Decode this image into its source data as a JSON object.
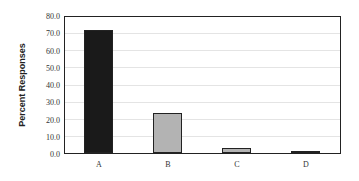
{
  "chart_data": {
    "type": "bar",
    "title": "",
    "xlabel": "",
    "ylabel": "Percent Responses",
    "ylim": [
      0,
      80
    ],
    "yticks": [
      "0.0",
      "10.0",
      "20.0",
      "30.0",
      "40.0",
      "50.0",
      "60.0",
      "70.0",
      "80.0"
    ],
    "categories": [
      "A",
      "B",
      "C",
      "D"
    ],
    "values": [
      73,
      24,
      3,
      1
    ],
    "colors": [
      "#1a1a1a",
      "#b3b3b3",
      "#b3b3b3",
      "#b3b3b3"
    ],
    "grid": true,
    "legend": null
  }
}
